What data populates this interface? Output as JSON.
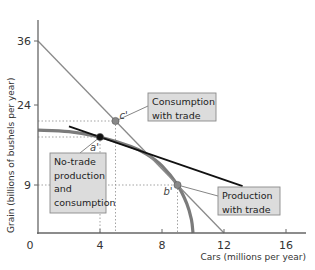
{
  "chart_data": {
    "type": "line",
    "title": "",
    "xlabel": "Cars (millions per year)",
    "ylabel": "Grain (billions of bushels per year)",
    "xlim": [
      0,
      18
    ],
    "ylim": [
      0,
      38
    ],
    "x_ticks": [
      0,
      4,
      8,
      12,
      16
    ],
    "x_tick_labels": [
      "0",
      "4",
      "8",
      "12",
      "16"
    ],
    "y_ticks": [
      9,
      24,
      36
    ],
    "y_tick_labels": [
      "9",
      "24",
      "36"
    ],
    "grid": false,
    "series": [
      {
        "name": "Production possibilities frontier",
        "style": "curve",
        "color": "#7b7b7b",
        "points": [
          [
            0,
            19.3
          ],
          [
            2,
            19.0
          ],
          [
            4,
            18.0
          ],
          [
            6,
            16.2
          ],
          [
            7,
            14.8
          ],
          [
            8,
            12.6
          ],
          [
            9,
            9
          ],
          [
            9.6,
            5.5
          ],
          [
            9.9,
            2.5
          ],
          [
            10,
            0
          ]
        ]
      },
      {
        "name": "Trade line",
        "style": "line",
        "color": "#8a8a8a",
        "points": [
          [
            0,
            36
          ],
          [
            12,
            0
          ]
        ]
      },
      {
        "name": "No-trade price line",
        "style": "line",
        "color": "#111111",
        "points": [
          [
            2,
            20
          ],
          [
            13.2,
            8.8
          ]
        ]
      }
    ],
    "points": [
      {
        "name": "consumption-with-trade",
        "label": "c'",
        "x": 5,
        "y": 21,
        "color": "#888888"
      },
      {
        "name": "no-trade-point",
        "label": "a'",
        "x": 4,
        "y": 18,
        "color": "#111111"
      },
      {
        "name": "production-with-trade",
        "label": "b'",
        "x": 9,
        "y": 9,
        "color": "#888888"
      }
    ],
    "guides": [
      {
        "x": 5,
        "y": 21
      },
      {
        "x": 9,
        "y": 9
      },
      {
        "x": 4,
        "y": 18
      }
    ],
    "annotations": [
      {
        "name": "consumption-with-trade-label",
        "lines": [
          "Consumption",
          "with trade"
        ],
        "target": "c'"
      },
      {
        "name": "no-trade-label",
        "lines": [
          "No-trade",
          "production",
          "and",
          "consumption"
        ],
        "target": "a'"
      },
      {
        "name": "production-with-trade-label",
        "lines": [
          "Production",
          "with trade"
        ],
        "target": "b'"
      }
    ]
  }
}
